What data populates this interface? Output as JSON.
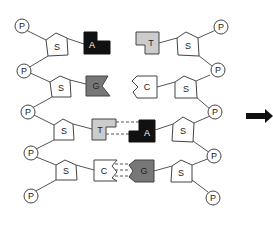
{
  "diagram": {
    "phosphate_label": "P",
    "sugar_label": "S",
    "left_strand": {
      "phosphates": [
        "P",
        "P",
        "P",
        "P",
        "P"
      ],
      "sugars": [
        "S",
        "S",
        "S",
        "S"
      ],
      "bases": [
        "A",
        "G",
        "T",
        "C"
      ]
    },
    "right_strand": {
      "phosphates": [
        "P",
        "P",
        "P",
        "P",
        "P"
      ],
      "sugars": [
        "S",
        "S",
        "S",
        "S"
      ],
      "bases": [
        "T",
        "C",
        "A",
        "G"
      ]
    },
    "base_pairs": [
      {
        "left": "T",
        "right": "A",
        "bonded": true,
        "hydrogen_bonds": 2
      },
      {
        "left": "C",
        "right": "G",
        "bonded": true,
        "hydrogen_bonds": 3
      }
    ],
    "colors": {
      "A": "#111111",
      "G": "#777777",
      "T": "#cccccc",
      "C": "#ffffff",
      "outline": "#444444",
      "arrow": "#111111"
    },
    "arrow": "right-arrow"
  }
}
